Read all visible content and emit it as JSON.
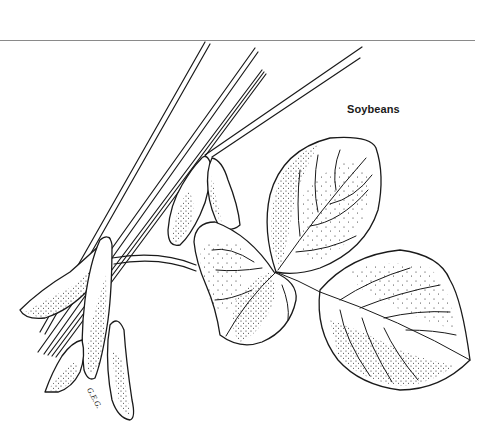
{
  "illustration": {
    "title": "Soybeans",
    "signature": "G.E.G.",
    "subject": "soybean plant branch with pods and trifoliate leaf",
    "style": "black ink line drawing with stipple shading",
    "colors": {
      "ink": "#1a1a1a",
      "background": "#ffffff",
      "rule": "#8a8a8a"
    }
  }
}
